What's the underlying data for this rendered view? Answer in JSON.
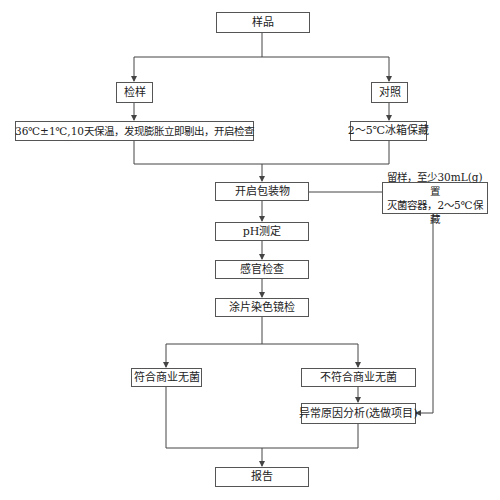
{
  "diagram": {
    "type": "flowchart",
    "nodes": {
      "sample": "样品",
      "test_sample": "检样",
      "control": "对照",
      "incubation": "36℃±1℃,10天保温，发现膨胀立即剔出，开启检查",
      "fridge": "2～5℃冰箱保藏",
      "open_package": "开启包装物",
      "retain_line1": "留样，至少30mL(g)置",
      "retain_line2": "灭菌容器，2～5℃保藏",
      "ph": "pH测定",
      "sensory": "感官检查",
      "smear": "涂片染色镜检",
      "compliant": "符合商业无菌",
      "noncompliant": "不符合商业无菌",
      "analysis": "异常原因分析(选做项目)",
      "report": "报告"
    },
    "edges": [
      [
        "sample",
        "test_sample"
      ],
      [
        "sample",
        "control"
      ],
      [
        "test_sample",
        "incubation"
      ],
      [
        "control",
        "fridge"
      ],
      [
        "incubation",
        "open_package"
      ],
      [
        "fridge",
        "open_package"
      ],
      [
        "open_package",
        "retain"
      ],
      [
        "open_package",
        "ph"
      ],
      [
        "ph",
        "sensory"
      ],
      [
        "sensory",
        "smear"
      ],
      [
        "smear",
        "compliant"
      ],
      [
        "smear",
        "noncompliant"
      ],
      [
        "noncompliant",
        "analysis"
      ],
      [
        "retain",
        "analysis"
      ],
      [
        "compliant",
        "report"
      ],
      [
        "analysis",
        "report"
      ]
    ],
    "colors": {
      "line": "#444444",
      "border": "#555555",
      "background": "#ffffff"
    }
  }
}
